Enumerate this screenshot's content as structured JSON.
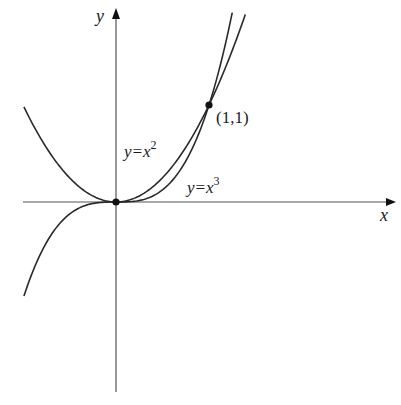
{
  "figure": {
    "width": 401,
    "height": 405,
    "background": "#ffffff",
    "stroke_color": "#2a2a2a",
    "axis_color": "#555555",
    "origin_px": [
      116,
      202
    ],
    "scale_px": [
      93,
      97
    ]
  },
  "axes": {
    "x_label": "x",
    "y_label": "y",
    "x_range": [
      -1.0,
      3.0
    ],
    "y_range": [
      -1.95,
      1.9
    ]
  },
  "curves": [
    {
      "name": "parabola",
      "equation_lhs": "y=x",
      "exponent": "2",
      "x_range": [
        -0.99,
        1.39
      ]
    },
    {
      "name": "cubic",
      "equation_lhs": "y=x",
      "exponent": "3",
      "x_range": [
        -0.99,
        1.25
      ]
    }
  ],
  "points": [
    {
      "name": "origin",
      "x": 0,
      "y": 0,
      "label": ""
    },
    {
      "name": "intersection",
      "x": 1,
      "y": 1,
      "label": "(1,1)"
    }
  ],
  "chart_data": {
    "type": "line",
    "title": "",
    "xlabel": "x",
    "ylabel": "y",
    "grid": false,
    "legend": "none (inline curve labels)",
    "series": [
      {
        "name": "y=x^2",
        "x": [
          -1,
          -0.5,
          0,
          0.5,
          1,
          1.25,
          1.39
        ],
        "values": [
          1,
          0.25,
          0,
          0.25,
          1,
          1.5625,
          1.93
        ]
      },
      {
        "name": "y=x^3",
        "x": [
          -1,
          -0.5,
          0,
          0.5,
          1,
          1.25
        ],
        "values": [
          -1,
          -0.125,
          0,
          0.125,
          1,
          1.95
        ]
      }
    ],
    "annotations": [
      {
        "text": "y=x^2",
        "at": [
          0.1,
          0.55
        ]
      },
      {
        "text": "y=x^3",
        "at": [
          0.75,
          0.15
        ]
      },
      {
        "text": "(1,1)",
        "at": [
          1,
          1
        ]
      }
    ],
    "marked_points": [
      [
        0,
        0
      ],
      [
        1,
        1
      ]
    ]
  }
}
